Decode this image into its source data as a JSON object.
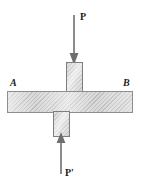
{
  "figure": {
    "labels": {
      "applied_force": "P",
      "reaction_force": "P'",
      "left_end": "A",
      "right_end": "B"
    },
    "icons": {
      "down_arrow": "arrow-down-icon",
      "up_arrow": "arrow-up-icon"
    },
    "colors": {
      "background": "#ffffff",
      "hatch_light": "#d7d7d7",
      "hatch_dark": "#b9b9b9",
      "outline": "#8e8e8e",
      "arrow": "#6f6f6f",
      "text": "#1a1a1a"
    },
    "parts": {
      "horizontal_bar": "horizontal-bar",
      "upper_block": "upper-vertical-block",
      "lower_block": "lower-vertical-block"
    }
  }
}
